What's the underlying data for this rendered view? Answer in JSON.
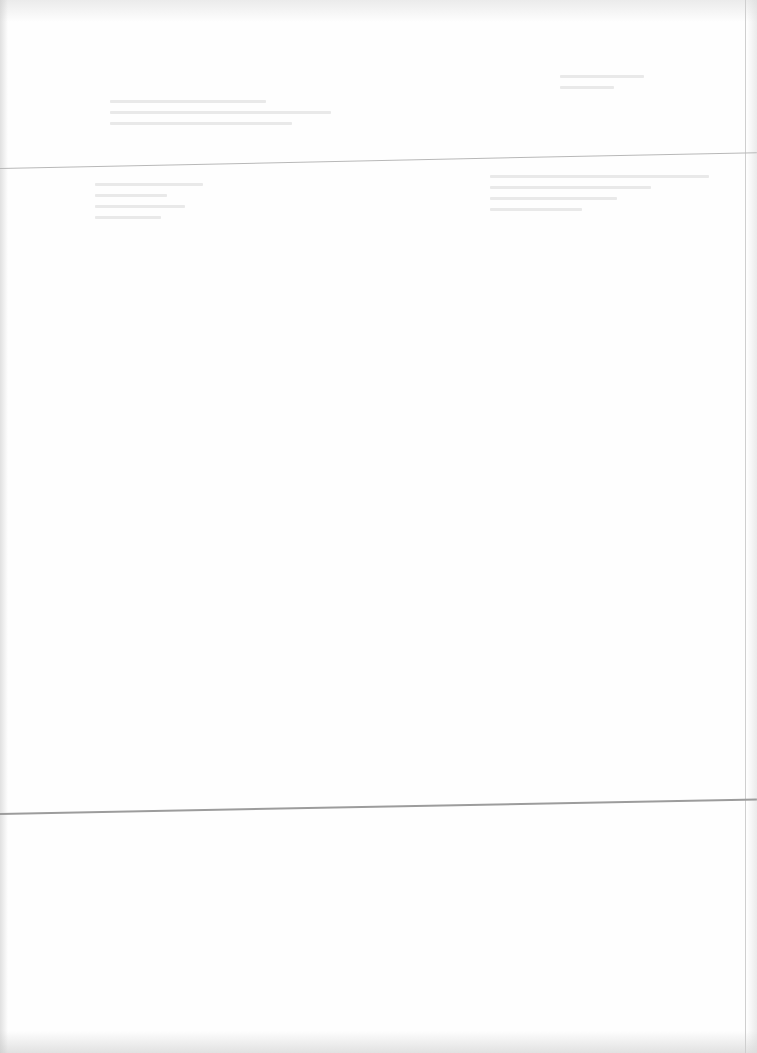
{
  "document": {
    "type": "scanned-page",
    "legible_text": [],
    "background_color": "#fefefe",
    "rule_color": "#a8a8a8"
  }
}
